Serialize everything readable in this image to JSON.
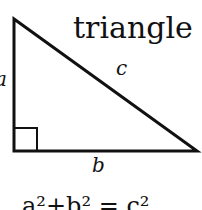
{
  "diagram": {
    "title": "triangle",
    "labels": {
      "a": "a",
      "b": "b",
      "c": "c"
    },
    "equation": "a²+b² = c²",
    "colors": {
      "stroke": "#111111",
      "background": "#ffffff"
    }
  }
}
